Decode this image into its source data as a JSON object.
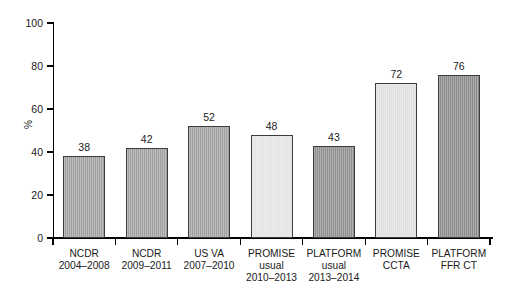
{
  "chart_data": {
    "type": "bar",
    "title": "",
    "subtitle": "",
    "xlabel": "",
    "ylabel": "%",
    "ylim": [
      0,
      100
    ],
    "yticks": [
      0,
      20,
      40,
      60,
      80,
      100
    ],
    "grid": false,
    "legend": "none",
    "categories": [
      "NCDR\n2004–2008",
      "NCDR\n2009–2011",
      "US VA\n2007–2010",
      "PROMISE\nusual\n2010–2013",
      "PLATFORM\nusual\n2013–2014",
      "PROMISE\nCCTA",
      "PLATFORM\nFFR CT"
    ],
    "values": [
      38,
      42,
      52,
      48,
      43,
      72,
      76
    ],
    "value_labels": [
      "38",
      "42",
      "52",
      "48",
      "43",
      "72",
      "76"
    ],
    "bar_colors": [
      "#a0a0a0",
      "#a0a0a0",
      "#a0a0a0",
      "#e3e3e3",
      "#8e8e8e",
      "#e0e0e0",
      "#8a8a8a"
    ],
    "bar_edge_color": "#3c3c3c",
    "axis_color": "#000000",
    "background_color": "#ffffff"
  }
}
